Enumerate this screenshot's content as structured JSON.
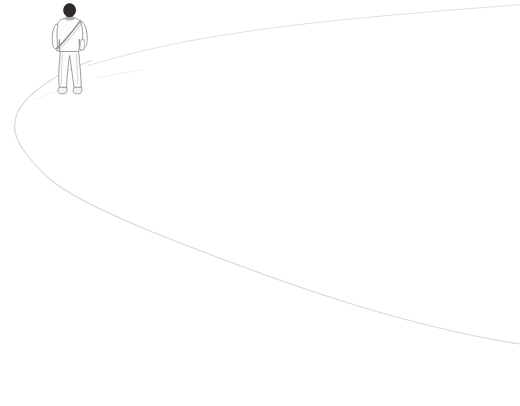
{
  "artwork": {
    "title": "Person Walking Away Along a Curving Path",
    "medium": "minimal line drawing",
    "canvas": {
      "width": 520,
      "height": 406
    },
    "background_color": "#ffffff",
    "line_color": "#d8d8dc",
    "line_color_faint": "#e4e4e8",
    "outline_color": "#8b8b90",
    "hair_color": "#2e2a2b",
    "skin_color": "#bfb5ae",
    "garment_fill": "#fdfdfd",
    "shoe_fill": "#f2f2f3"
  },
  "path_lines": [
    {
      "name": "upper-path-edge",
      "description": "faint curve sweeping from the figure's feet up to the top right corner",
      "stroke": "#e1e1e5",
      "stroke_width": 1.1,
      "points": [
        [
          88,
          65
        ],
        [
          150,
          48
        ],
        [
          220,
          35
        ],
        [
          290,
          26
        ],
        [
          380,
          17
        ],
        [
          460,
          10
        ],
        [
          520,
          5
        ]
      ]
    },
    {
      "name": "lower-path-edge",
      "description": "faint curve from the figure's feet bending left to a vertex then sweeping down to the right edge",
      "stroke": "#d9d9de",
      "stroke_width": 1.2,
      "points": [
        [
          84,
          62
        ],
        [
          50,
          80
        ],
        [
          26,
          100
        ],
        [
          15,
          122
        ],
        [
          20,
          145
        ],
        [
          40,
          170
        ],
        [
          60,
          192
        ],
        [
          140,
          225
        ],
        [
          220,
          255
        ],
        [
          300,
          282
        ],
        [
          380,
          308
        ],
        [
          460,
          330
        ],
        [
          520,
          343
        ]
      ]
    }
  ],
  "figure": {
    "name": "walking-person",
    "pose": "walking away from viewer, seen from behind",
    "bounding_box": {
      "x": 50,
      "y": 6,
      "width": 44,
      "height": 90
    },
    "parts": [
      {
        "name": "head",
        "label": "Head with dark hair"
      },
      {
        "name": "neck",
        "label": "Neck"
      },
      {
        "name": "torso",
        "label": "Light jacket / shirt"
      },
      {
        "name": "left-arm",
        "label": "Left arm"
      },
      {
        "name": "right-arm",
        "label": "Right arm"
      },
      {
        "name": "messenger-strap",
        "label": "Diagonal shoulder bag strap"
      },
      {
        "name": "trousers",
        "label": "Light trousers"
      },
      {
        "name": "left-shoe",
        "label": "Left shoe"
      },
      {
        "name": "right-shoe",
        "label": "Right shoe"
      }
    ]
  },
  "accessibility": {
    "alt_text": "A sparse pencil-line illustration of a person with a shoulder bag walking away along a broad curving path drawn with two faint gray lines on a white background."
  }
}
